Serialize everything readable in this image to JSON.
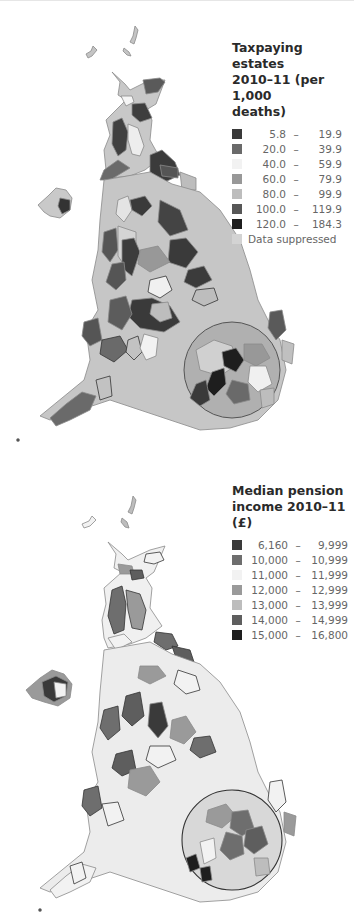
{
  "maps": [
    {
      "id": "taxpaying-estates",
      "legend": {
        "title_lines": [
          "Taxpaying estates",
          "2010–11 (per 1,000",
          "deaths)"
        ],
        "classes": [
          {
            "low": "5.8",
            "high": "19.9",
            "color": "#3a3a3a"
          },
          {
            "low": "20.0",
            "high": "39.9",
            "color": "#6a6a6a"
          },
          {
            "low": "40.0",
            "high": "59.9",
            "color": "#f2f2f2"
          },
          {
            "low": "60.0",
            "high": "79.9",
            "color": "#989898"
          },
          {
            "low": "80.0",
            "high": "99.9",
            "color": "#bdbdbd"
          },
          {
            "low": "100.0",
            "high": "119.9",
            "color": "#575757"
          },
          {
            "low": "120.0",
            "high": "184.3",
            "color": "#1e1e1e"
          }
        ],
        "suppressed": {
          "label": "Data suppressed",
          "color": "#d3d3d3"
        },
        "dash": "–"
      }
    },
    {
      "id": "median-pension-income",
      "legend": {
        "title_lines": [
          "Median pension",
          "income 2010–11 (£)"
        ],
        "classes": [
          {
            "low": "6,160",
            "high": "9,999",
            "color": "#3a3a3a"
          },
          {
            "low": "10,000",
            "high": "10,999",
            "color": "#6e6e6e"
          },
          {
            "low": "11,000",
            "high": "11,999",
            "color": "#f2f2f2"
          },
          {
            "low": "12,000",
            "high": "12,999",
            "color": "#9a9a9a"
          },
          {
            "low": "13,000",
            "high": "13,999",
            "color": "#bdbdbd"
          },
          {
            "low": "14,000",
            "high": "14,999",
            "color": "#5e5e5e"
          },
          {
            "low": "15,000",
            "high": "16,800",
            "color": "#1e1e1e"
          }
        ],
        "dash": "–"
      }
    }
  ]
}
